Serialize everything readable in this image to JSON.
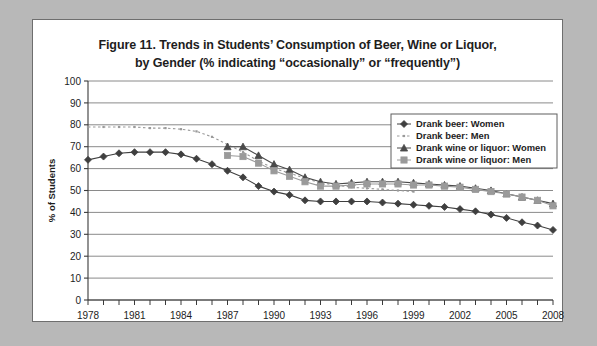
{
  "figure": {
    "title_line1": "Figure 11. Trends in Students’ Consumption of Beer, Wine or Liquor,",
    "title_line2": "by Gender (% indicating “occasionally” or “frequently”)"
  },
  "chart_data": {
    "type": "line",
    "title": "Figure 11. Trends in Students’ Consumption of Beer, Wine or Liquor, by Gender (% indicating “occasionally” or “frequently”)",
    "xlabel": "",
    "ylabel": "% of Students",
    "ylim": [
      0,
      100
    ],
    "ytick_step": 10,
    "yticks": [
      0,
      10,
      20,
      30,
      40,
      50,
      60,
      70,
      80,
      90,
      100
    ],
    "xlim": [
      1978,
      2008
    ],
    "xticks_labeled": [
      1978,
      1981,
      1984,
      1987,
      1990,
      1993,
      1996,
      1999,
      2002,
      2005,
      2008
    ],
    "x_minor_tick_step": 1,
    "grid": "horizontal",
    "legend_position": "upper-right-inside",
    "x": [
      1978,
      1979,
      1980,
      1981,
      1982,
      1983,
      1984,
      1985,
      1986,
      1987,
      1988,
      1989,
      1990,
      1991,
      1992,
      1993,
      1994,
      1995,
      1996,
      1997,
      1998,
      1999,
      2000,
      2001,
      2002,
      2003,
      2004,
      2005,
      2006,
      2007,
      2008
    ],
    "series": [
      {
        "name": "Drank beer: Women",
        "marker": "diamond",
        "line": "solid",
        "color": "#3f3f3f",
        "values": [
          64,
          65.5,
          67,
          67.5,
          67.5,
          67.5,
          66.5,
          64.5,
          62,
          59,
          56,
          52,
          49.5,
          48,
          45.5,
          45,
          45,
          45,
          45,
          44.5,
          44,
          43.5,
          43,
          42.5,
          41.5,
          40.5,
          39,
          37.5,
          35.5,
          34,
          32
        ]
      },
      {
        "name": "Drank beer: Men",
        "marker": "none",
        "line": "dotted",
        "color": "#9a9a9a",
        "values": [
          79,
          79,
          79,
          79,
          78.5,
          78.5,
          78,
          77,
          74.5,
          71,
          67.5,
          63.5,
          60,
          58,
          55.5,
          53.5,
          52.5,
          51.5,
          51,
          50.5,
          50,
          49.5,
          null,
          null,
          null,
          null,
          null,
          null,
          null,
          null,
          null
        ]
      },
      {
        "name": "Drank wine or liquor: Women",
        "marker": "triangle",
        "line": "solid",
        "color": "#4a4a4a",
        "values": [
          null,
          null,
          null,
          null,
          null,
          null,
          null,
          null,
          null,
          70,
          70,
          66,
          62,
          59.5,
          56,
          54,
          53,
          53.5,
          54,
          54,
          54,
          53.5,
          53,
          52.5,
          52,
          51,
          50,
          48.5,
          47,
          45.5,
          44
        ]
      },
      {
        "name": "Drank wine or liquor: Men",
        "marker": "square",
        "line": "solid",
        "color": "#9a9a9a",
        "values": [
          null,
          null,
          null,
          null,
          null,
          null,
          null,
          null,
          null,
          66,
          65.5,
          62.5,
          59,
          56.5,
          54,
          52,
          52,
          52.5,
          53,
          53,
          53,
          52.5,
          52.5,
          52,
          51.5,
          50.5,
          49.5,
          48.5,
          47,
          45.5,
          43
        ]
      }
    ]
  },
  "legend": {
    "items": [
      {
        "label": "Drank beer: Women"
      },
      {
        "label": "Drank beer: Men"
      },
      {
        "label": "Drank wine or liquor: Women"
      },
      {
        "label": "Drank wine or liquor: Men"
      }
    ]
  }
}
